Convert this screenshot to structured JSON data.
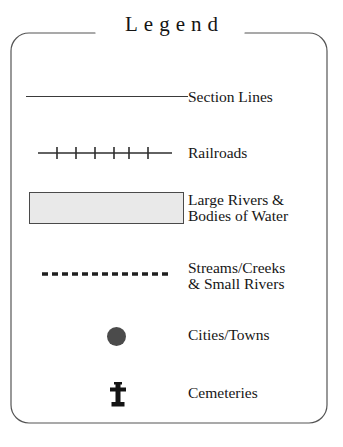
{
  "legend": {
    "title": "Legend",
    "frame_color": "#555555",
    "text_color": "#161616",
    "background": "#ffffff",
    "rows": [
      {
        "id": "section-lines",
        "symbol": "solid-line-icon",
        "label": "Section Lines"
      },
      {
        "id": "railroads",
        "symbol": "railroad-line-icon",
        "label": "Railroads",
        "tick_count": 6
      },
      {
        "id": "large-rivers",
        "symbol": "water-polygon-icon",
        "label": "Large Rivers &\nBodies of Water",
        "fill_color": "#e9e9e9",
        "stroke_color": "#4a4a4a"
      },
      {
        "id": "streams",
        "symbol": "dashed-line-icon",
        "label": "Streams/Creeks\n& Small Rivers"
      },
      {
        "id": "cities",
        "symbol": "filled-circle-icon",
        "label": "Cities/Towns",
        "dot_color": "#4b4b4b"
      },
      {
        "id": "cemeteries",
        "symbol": "cross-icon",
        "label": "Cemeteries",
        "cross_color": "#141414"
      }
    ]
  }
}
